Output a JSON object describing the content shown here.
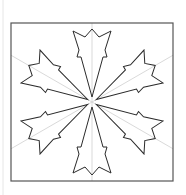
{
  "diagram": {
    "type": "six-armed-snowflake-in-square",
    "canvas": {
      "width": 186,
      "height": 195,
      "background": "#ffffff"
    },
    "left_margin_line": {
      "x": 3,
      "y1": 0,
      "y2": 195,
      "color": "#e6e6e6"
    },
    "frame": {
      "x": 11,
      "y": 23,
      "width": 162,
      "height": 158,
      "stroke": "#555555",
      "stroke_width": 1.2
    },
    "center": {
      "x": 92,
      "y": 102
    },
    "guide_lines": {
      "color": "#cfcfcf",
      "stroke_width": 0.8,
      "angles_deg": [
        90,
        30,
        -30,
        -90,
        -150,
        150
      ]
    },
    "arm": {
      "count": 6,
      "rotations_deg": [
        0,
        60,
        120,
        180,
        240,
        300
      ],
      "stroke": "#2a2a2a",
      "stroke_width": 1,
      "fill": "#ffffff",
      "points_local": [
        [
          0,
          -5
        ],
        [
          -11,
          -45
        ],
        [
          -15,
          -45
        ],
        [
          -13,
          -52
        ],
        [
          -19,
          -71
        ],
        [
          -7,
          -65
        ],
        [
          0,
          -73
        ],
        [
          7,
          -65
        ],
        [
          19,
          -71
        ],
        [
          13,
          -52
        ],
        [
          15,
          -45
        ],
        [
          11,
          -45
        ]
      ]
    }
  }
}
